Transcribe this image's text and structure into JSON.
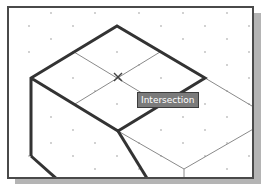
{
  "tooltip": {
    "label": "Intersection"
  },
  "snap_marker": {
    "type": "intersection",
    "icon": "x-marker-icon",
    "x": 118,
    "y": 77
  },
  "colors": {
    "frame": "#4a4a4a",
    "shadow": "#b4b4b4",
    "thick_line": "#333333",
    "thin_line": "#8a8a8a",
    "grid_dot": "#bdbdbd",
    "tooltip_bg": "#7b7b7b",
    "tooltip_text": "#ffffff"
  }
}
